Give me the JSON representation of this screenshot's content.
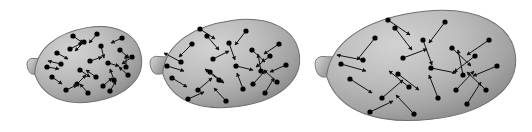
{
  "figure": {
    "background_color": "#ffffff",
    "width": 532,
    "height": 132,
    "caption": "",
    "balloon_fill_light": "#c6c6c6",
    "balloon_fill_mid": "#ababab",
    "balloon_fill_dark": "#848484",
    "balloon_outline_color": "#6e6e6e",
    "knot_fill_light": "#cfcfcf",
    "knot_fill_dark": "#8c8c8c",
    "particle_color": "#000000",
    "arrow_color": "#111111",
    "particle_radius": 2.6,
    "arrow_stroke_width": 1.0
  },
  "chart_data": {
    "type": "scatter",
    "xlabel": "",
    "ylabel": "",
    "legend": [],
    "grid": false,
    "panels": [
      {
        "id": "balloon-1",
        "label": "small balloon",
        "particle_count": 24,
        "mean_arrow_length_px": 11,
        "body": {
          "cx": 88,
          "cy": 65,
          "rx": 54,
          "ry": 37,
          "rotation_deg": -10
        },
        "knot": {
          "x": 27,
          "y": 58,
          "w": 16,
          "h": 17
        }
      },
      {
        "id": "balloon-2",
        "label": "medium balloon",
        "particle_count": 24,
        "mean_arrow_length_px": 16,
        "body": {
          "cx": 231,
          "cy": 64,
          "rx": 69,
          "ry": 43,
          "rotation_deg": -8
        },
        "knot": {
          "x": 150,
          "y": 56,
          "w": 18,
          "h": 19
        }
      },
      {
        "id": "balloon-3",
        "label": "large balloon",
        "particle_count": 24,
        "mean_arrow_length_px": 24,
        "body": {
          "cx": 421,
          "cy": 66,
          "rx": 95,
          "ry": 54,
          "rotation_deg": -6
        },
        "knot": {
          "x": 315,
          "y": 56,
          "w": 21,
          "h": 22
        }
      }
    ],
    "particles": {
      "balloon-1": [
        {
          "x": 61,
          "y": 64,
          "dx": -13,
          "dy": -3
        },
        {
          "x": 52,
          "y": 77,
          "dx": 10,
          "dy": 7
        },
        {
          "x": 70,
          "y": 49,
          "dx": 12,
          "dy": -6
        },
        {
          "x": 77,
          "y": 84,
          "dx": 9,
          "dy": -9
        },
        {
          "x": 84,
          "y": 42,
          "dx": -9,
          "dy": 9
        },
        {
          "x": 90,
          "y": 61,
          "dx": 12,
          "dy": -4
        },
        {
          "x": 96,
          "y": 77,
          "dx": -10,
          "dy": -7
        },
        {
          "x": 101,
          "y": 46,
          "dx": 3,
          "dy": 12
        },
        {
          "x": 108,
          "y": 63,
          "dx": 11,
          "dy": 3
        },
        {
          "x": 114,
          "y": 80,
          "dx": -4,
          "dy": -11
        },
        {
          "x": 120,
          "y": 50,
          "dx": 9,
          "dy": 8
        },
        {
          "x": 126,
          "y": 67,
          "dx": 0,
          "dy": -12
        },
        {
          "x": 66,
          "y": 90,
          "dx": 11,
          "dy": -5
        },
        {
          "x": 88,
          "y": 93,
          "dx": -8,
          "dy": -9
        },
        {
          "x": 110,
          "y": 91,
          "dx": 6,
          "dy": -10
        },
        {
          "x": 73,
          "y": 36,
          "dx": 10,
          "dy": 7
        },
        {
          "x": 97,
          "y": 34,
          "dx": -8,
          "dy": 9
        },
        {
          "x": 122,
          "y": 38,
          "dx": -11,
          "dy": 5
        },
        {
          "x": 132,
          "y": 57,
          "dx": -10,
          "dy": 7
        },
        {
          "x": 57,
          "y": 53,
          "dx": 11,
          "dy": 6
        },
        {
          "x": 80,
          "y": 70,
          "dx": 10,
          "dy": 7
        },
        {
          "x": 103,
          "y": 86,
          "dx": 9,
          "dy": -8
        },
        {
          "x": 128,
          "y": 75,
          "dx": -9,
          "dy": -8
        },
        {
          "x": 47,
          "y": 67,
          "dx": 12,
          "dy": 2
        }
      ],
      "balloon-2": [
        {
          "x": 181,
          "y": 62,
          "dx": -17,
          "dy": -9
        },
        {
          "x": 172,
          "y": 78,
          "dx": 15,
          "dy": 9
        },
        {
          "x": 192,
          "y": 44,
          "dx": -13,
          "dy": 13
        },
        {
          "x": 198,
          "y": 90,
          "dx": 14,
          "dy": -12
        },
        {
          "x": 207,
          "y": 36,
          "dx": 12,
          "dy": 14
        },
        {
          "x": 213,
          "y": 59,
          "dx": 16,
          "dy": -8
        },
        {
          "x": 219,
          "y": 80,
          "dx": -14,
          "dy": -11
        },
        {
          "x": 229,
          "y": 43,
          "dx": 6,
          "dy": 17
        },
        {
          "x": 236,
          "y": 66,
          "dx": 17,
          "dy": 4
        },
        {
          "x": 243,
          "y": 89,
          "dx": -6,
          "dy": -16
        },
        {
          "x": 252,
          "y": 50,
          "dx": 13,
          "dy": 12
        },
        {
          "x": 261,
          "y": 71,
          "dx": -3,
          "dy": -17
        },
        {
          "x": 188,
          "y": 99,
          "dx": 16,
          "dy": -7
        },
        {
          "x": 226,
          "y": 101,
          "dx": -12,
          "dy": -13
        },
        {
          "x": 265,
          "y": 93,
          "dx": 9,
          "dy": -15
        },
        {
          "x": 200,
          "y": 29,
          "dx": 15,
          "dy": 10
        },
        {
          "x": 246,
          "y": 31,
          "dx": -11,
          "dy": 14
        },
        {
          "x": 279,
          "y": 44,
          "dx": -15,
          "dy": 10
        },
        {
          "x": 286,
          "y": 65,
          "dx": -16,
          "dy": 7
        },
        {
          "x": 277,
          "y": 82,
          "dx": -13,
          "dy": -12
        },
        {
          "x": 167,
          "y": 66,
          "dx": 17,
          "dy": 5
        },
        {
          "x": 210,
          "y": 72,
          "dx": 14,
          "dy": 11
        },
        {
          "x": 253,
          "y": 84,
          "dx": 12,
          "dy": -13
        },
        {
          "x": 270,
          "y": 56,
          "dx": -14,
          "dy": 11
        }
      ],
      "balloon-3": [
        {
          "x": 363,
          "y": 60,
          "dx": -26,
          "dy": -5
        },
        {
          "x": 350,
          "y": 79,
          "dx": 22,
          "dy": 14
        },
        {
          "x": 375,
          "y": 38,
          "dx": -18,
          "dy": 22
        },
        {
          "x": 382,
          "y": 98,
          "dx": 21,
          "dy": -18
        },
        {
          "x": 395,
          "y": 28,
          "dx": 17,
          "dy": 22
        },
        {
          "x": 403,
          "y": 58,
          "dx": 24,
          "dy": -9
        },
        {
          "x": 409,
          "y": 87,
          "dx": -20,
          "dy": -16
        },
        {
          "x": 423,
          "y": 40,
          "dx": 9,
          "dy": 25
        },
        {
          "x": 431,
          "y": 68,
          "dx": 25,
          "dy": 5
        },
        {
          "x": 438,
          "y": 98,
          "dx": -9,
          "dy": -23
        },
        {
          "x": 452,
          "y": 48,
          "dx": 19,
          "dy": 18
        },
        {
          "x": 463,
          "y": 75,
          "dx": -5,
          "dy": -25
        },
        {
          "x": 370,
          "y": 112,
          "dx": 23,
          "dy": -11
        },
        {
          "x": 414,
          "y": 114,
          "dx": -18,
          "dy": -19
        },
        {
          "x": 467,
          "y": 104,
          "dx": 14,
          "dy": -22
        },
        {
          "x": 388,
          "y": 20,
          "dx": 22,
          "dy": 15
        },
        {
          "x": 445,
          "y": 22,
          "dx": -16,
          "dy": 21
        },
        {
          "x": 489,
          "y": 40,
          "dx": -22,
          "dy": 15
        },
        {
          "x": 497,
          "y": 66,
          "dx": -24,
          "dy": 10
        },
        {
          "x": 486,
          "y": 90,
          "dx": -19,
          "dy": -18
        },
        {
          "x": 341,
          "y": 64,
          "dx": 25,
          "dy": 7
        },
        {
          "x": 398,
          "y": 74,
          "dx": 21,
          "dy": 16
        },
        {
          "x": 456,
          "y": 90,
          "dx": 18,
          "dy": -19
        },
        {
          "x": 475,
          "y": 56,
          "dx": -21,
          "dy": 16
        }
      ]
    }
  }
}
